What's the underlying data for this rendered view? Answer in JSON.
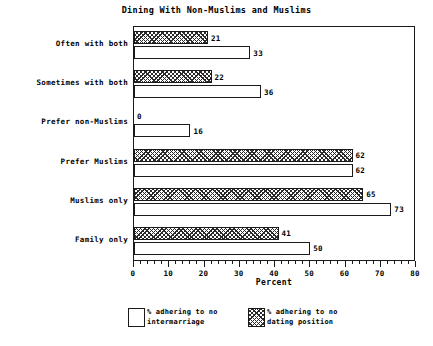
{
  "chart_data": {
    "type": "bar",
    "orientation": "horizontal",
    "title": "Dining With Non-Muslims and Muslims",
    "xlabel": "Percent",
    "ylabel": "",
    "xlim": [
      0,
      80
    ],
    "xticks": [
      0,
      10,
      20,
      30,
      40,
      50,
      60,
      70,
      80
    ],
    "xtick_labels": [
      "0",
      "10",
      "20",
      "30",
      "40",
      "50",
      "60",
      "70",
      "80"
    ],
    "minor_tick_step": 2,
    "grid": false,
    "legend_position": "below-axes",
    "categories": [
      "Often with both",
      "Sometimes with both",
      "Prefer non-Muslims",
      "Prefer Muslims",
      "Muslims only",
      "Family only"
    ],
    "series": [
      {
        "name": "% adhering to no dating position",
        "style": "crosshatch",
        "values": [
          21,
          22,
          0,
          62,
          65,
          41
        ],
        "value_labels": [
          "21",
          "22",
          "0",
          "62",
          "65",
          "41"
        ]
      },
      {
        "name": "% adhering to no intermarriage",
        "style": "white",
        "values": [
          33,
          36,
          16,
          62,
          73,
          50
        ],
        "value_labels": [
          "33",
          "36",
          "16",
          "62",
          "73",
          "50"
        ]
      }
    ]
  },
  "legend": {
    "entries": [
      {
        "label": "% adhering to no\nintermarriage",
        "style": "white"
      },
      {
        "label": "% adhering to no\ndating position",
        "style": "crosshatch"
      }
    ]
  },
  "colors": {
    "background": "#ffffff",
    "foreground": "#1a1a1a",
    "hatch": "#2b2b2b",
    "bar_fill": "#ffffff"
  }
}
